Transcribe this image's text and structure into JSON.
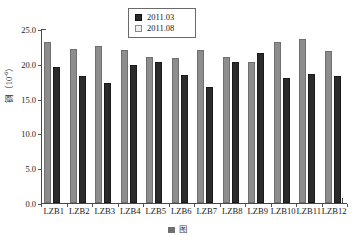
{
  "chart_data": {
    "type": "bar",
    "title": "",
    "xlabel": "",
    "ylabel": "铜（10⁻⁶）",
    "ylabel_text": "铜（10",
    "ylabel_exponent": "-6",
    "ylabel_tail": "）",
    "ylim": [
      0.0,
      25.0
    ],
    "ytick_labels": [
      "25.0",
      "20.0",
      "15.0",
      "10.0",
      "5.0",
      "0.0"
    ],
    "ytick_values": [
      25.0,
      20.0,
      15.0,
      10.0,
      5.0,
      0.0
    ],
    "grid": false,
    "legend_position": "top-center",
    "categories": [
      "LZB1",
      "LZB2",
      "LZB3",
      "LZB4",
      "LZB5",
      "LZB6",
      "LZB7",
      "LZB8",
      "LZB9",
      "LZB10",
      "LZB11",
      "LZB12"
    ],
    "series": [
      {
        "name": "2011.08",
        "color": "#8d8d8d",
        "order_in_group": 1,
        "values": [
          23.1,
          22.2,
          22.6,
          22.0,
          21.0,
          20.8,
          22.0,
          21.0,
          20.3,
          23.1,
          23.5,
          21.9
        ]
      },
      {
        "name": "2011.03",
        "color": "#2b2b2b",
        "order_in_group": 2,
        "values": [
          19.6,
          18.3,
          17.2,
          19.9,
          20.2,
          18.4,
          16.6,
          20.2,
          21.6,
          17.9,
          18.5,
          18.2
        ]
      }
    ]
  },
  "legend": {
    "entries": [
      {
        "label": "2011.03",
        "swatch": "dark"
      },
      {
        "label": "2011.08",
        "swatch": "light"
      }
    ]
  },
  "caption": {
    "text": "图"
  },
  "colors": {
    "series_light": "#8d8d8d",
    "series_dark": "#2b2b2b",
    "axis": "#4a4a4a",
    "text": "#1a1a1a",
    "background": "#ffffff"
  }
}
